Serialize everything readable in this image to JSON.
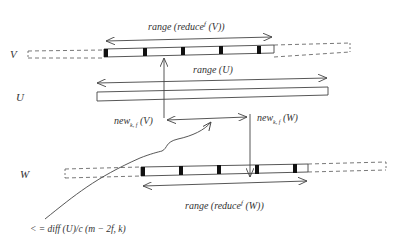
{
  "diagram": {
    "title": "",
    "colors": {
      "line": "#444444",
      "text": "#333333",
      "tick": "#111111",
      "background": "#ffffff"
    },
    "rows": [
      {
        "id": "V",
        "label": "V"
      },
      {
        "id": "U",
        "label": "U"
      },
      {
        "id": "W",
        "label": "W"
      }
    ],
    "labels": {
      "range_reduce_v": "range (reduce",
      "range_reduce_v_sup": "f",
      "range_reduce_v_tail": " (V))",
      "range_u": "range (U)",
      "new_v": "new",
      "new_v_sub": "k, f",
      "new_v_tail": " (V)",
      "new_w": "new",
      "new_w_sub": "k, f",
      "new_w_tail": " (W)",
      "range_reduce_w": "range (reduce",
      "range_reduce_w_sup": "f",
      "range_reduce_w_tail": " (W))",
      "bound_formula": "< = diff (U)/c (m − 2f, k)"
    }
  }
}
